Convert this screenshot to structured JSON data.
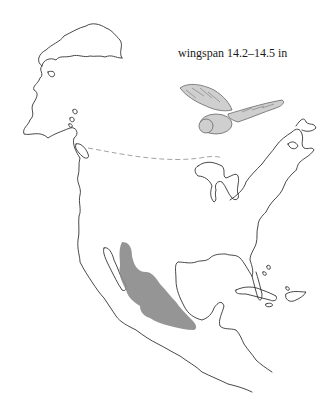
{
  "caption": "wingspan 14.2–14.5 in",
  "map": {
    "region": "North America",
    "range_color": "#8a8a8a",
    "coast_color": "#333333",
    "border_color": "#999999"
  },
  "illustration": {
    "subject": "owl-in-flight"
  }
}
